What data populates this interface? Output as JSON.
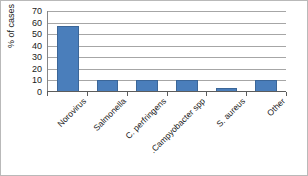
{
  "chart_data": {
    "type": "bar",
    "title": "",
    "subtitle": "",
    "xlabel": "",
    "ylabel": "% of cases",
    "categories": [
      "Norovirus",
      "Salmonella",
      "C. perfringens",
      "Campyobacter spp.",
      "S. aureus",
      "Other"
    ],
    "values": [
      57,
      10,
      10,
      10,
      3,
      10
    ],
    "ylim": [
      0,
      70
    ],
    "yticks": [
      0,
      10,
      20,
      30,
      40,
      50,
      60,
      70
    ],
    "ytick_labels": [
      "0",
      "10",
      "20",
      "30",
      "40",
      "50",
      "60",
      "70"
    ],
    "grid": true,
    "grid_axis": "y",
    "legend": false,
    "legend_position": "none",
    "xtick_label_rotation": -45,
    "series": [
      {
        "name": "% of cases",
        "values": [
          57,
          10,
          10,
          10,
          3,
          10
        ]
      }
    ]
  },
  "style": {
    "bar_color": "#4a7ebb",
    "bar_edge_color": "#3b6698",
    "gridline_color": "#a6a6a6",
    "axis_color": "#5c5c5c",
    "text_color": "#1a1a1a",
    "background_color": "#ffffff",
    "frame_border_color": "#b9b9b9"
  }
}
